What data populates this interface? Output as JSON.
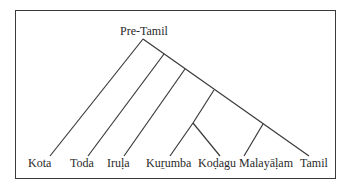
{
  "diagram": {
    "type": "tree",
    "root": "Pre-Tamil",
    "leaves": [
      "Kota",
      "Toda",
      "Iruḷa",
      "Kuṟumba",
      "Koḍagu",
      "Malayāḷam",
      "Tamil"
    ],
    "structure": "(Kota, (Toda, (Iruḷa, ((Kuṟumba, Koḍagu), (Malayāḷam, Tamil)))))",
    "line_color": "#3a3a3a"
  },
  "labels": {
    "root": "Pre-Tamil",
    "kota": "Kota",
    "toda": "Toda",
    "irula": "Iruḷa",
    "kurumba": "Kuṟumba",
    "kodagu": "Koḍagu",
    "malayalam": "Malayāḷam",
    "tamil": "Tamil"
  }
}
